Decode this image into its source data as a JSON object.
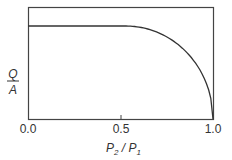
{
  "chart_data": {
    "type": "line",
    "title": "",
    "xlabel": "P2 / P1",
    "ylabel": "Q / A",
    "xlim": [
      0.0,
      1.0
    ],
    "ylim": [
      0,
      1
    ],
    "x_ticks": [
      "0.0",
      "0.5",
      "1.0"
    ],
    "y_ticks": [],
    "grid": false,
    "legend": null,
    "series": [
      {
        "name": "Q/A",
        "x": [
          0.0,
          0.53,
          0.6,
          0.7,
          0.8,
          0.9,
          0.95,
          1.0
        ],
        "y": [
          0.83,
          0.83,
          0.8,
          0.72,
          0.6,
          0.4,
          0.25,
          0.0
        ]
      }
    ]
  },
  "labels": {
    "x_axis_main": "P",
    "x_axis_sub1": "2",
    "x_axis_slash": " / ",
    "x_axis_main2": "P",
    "x_axis_sub2": "1",
    "y_axis_numerator": "Q",
    "y_axis_denominator": "A",
    "tick_0": "0.0",
    "tick_1": "0.5",
    "tick_2": "1.0"
  }
}
